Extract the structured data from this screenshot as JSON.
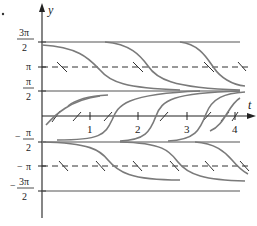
{
  "figure": {
    "type": "direction field with solution curves",
    "axes": {
      "x_label": "t",
      "y_label": "y",
      "x_ticks": [
        "1",
        "2",
        "3",
        "4"
      ],
      "y_ticks": [
        {
          "num": "3π",
          "den": "2",
          "sign": ""
        },
        {
          "num": "π",
          "den": "",
          "sign": ""
        },
        {
          "num": "π",
          "den": "2",
          "sign": ""
        },
        {
          "num": "π",
          "den": "2",
          "sign": "−"
        },
        {
          "num": "π",
          "den": "",
          "sign": "−"
        },
        {
          "num": "3π",
          "den": "2",
          "sign": "−"
        }
      ]
    },
    "equilibria": {
      "stable": [
        "3π/2",
        "π/2",
        "−π/2",
        "−3π/2"
      ],
      "unstable": [
        "π",
        "0",
        "−π"
      ]
    },
    "colors": {
      "axis": "#222222",
      "curve": "#7a7a7a",
      "dashed": "#333333"
    }
  }
}
